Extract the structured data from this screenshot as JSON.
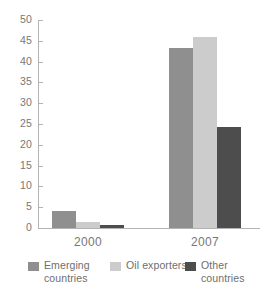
{
  "chart_data": {
    "type": "bar",
    "title": "",
    "subtitle": "",
    "xlabel": "",
    "ylabel": "",
    "categories": [
      "2000",
      "2007"
    ],
    "series": [
      {
        "name": "Emerging\ncountries",
        "legend_label": "Emerging\ncountries",
        "color": "#8f8f8f",
        "values": [
          4.0,
          43.3
        ]
      },
      {
        "name": "Oil exporters",
        "legend_label": "Oil exporters",
        "color": "#cccccc",
        "values": [
          1.5,
          46.0
        ]
      },
      {
        "name": "Other\ncountries",
        "legend_label": "Other\ncountries",
        "color": "#4d4d4d",
        "values": [
          0.7,
          24.2
        ]
      }
    ],
    "ylim": [
      0,
      50
    ],
    "ytick_step": 5,
    "yticks": [
      0,
      5,
      10,
      15,
      20,
      25,
      30,
      35,
      40,
      45,
      50
    ],
    "ytick_labels": [
      "0",
      "5",
      "10",
      "15",
      "20",
      "25",
      "30",
      "35",
      "40",
      "45",
      "50"
    ],
    "grid": false,
    "legend_position": "bottom",
    "annotations": []
  },
  "axes": {
    "axis_color": "#b3b3b3",
    "tick_label_color": "#777777"
  },
  "legend": {
    "entries": [
      {
        "label": "Emerging\ncountries",
        "color": "#8f8f8f"
      },
      {
        "label": "Oil exporters",
        "color": "#cccccc"
      },
      {
        "label": "Other\ncountries",
        "color": "#4d4d4d"
      }
    ]
  }
}
